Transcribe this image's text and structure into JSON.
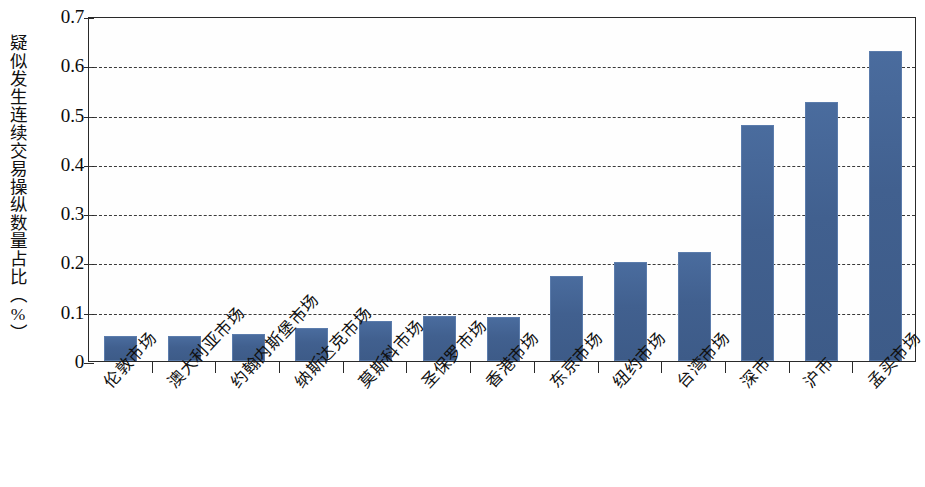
{
  "chart_data": {
    "type": "bar",
    "title": "",
    "xlabel": "",
    "ylabel": "疑似发生连续交易操纵数量占比（%）",
    "ylim": [
      0,
      0.7
    ],
    "ytick_labels": [
      "0.7",
      "0.6",
      "0.5",
      "0.4",
      "0.3",
      "0.2",
      "0.1",
      "0"
    ],
    "ytick_values": [
      0.7,
      0.6,
      0.5,
      0.4,
      0.3,
      0.2,
      0.1,
      0
    ],
    "grid": true,
    "grid_style": "dashed-horizontal",
    "legend": null,
    "bar_color": "#41608f",
    "categories": [
      "伦敦市场",
      "澳大利亚市场",
      "约翰内斯堡市场",
      "纳斯达克市场",
      "莫斯科市场",
      "圣保罗市场",
      "香港市场",
      "东京市场",
      "纽约市场",
      "台湾市场",
      "深市",
      "沪市",
      "孟买市场"
    ],
    "values": [
      0.05,
      0.05,
      0.055,
      0.066,
      0.082,
      0.092,
      0.089,
      0.172,
      0.201,
      0.222,
      0.478,
      0.525,
      0.63
    ]
  }
}
